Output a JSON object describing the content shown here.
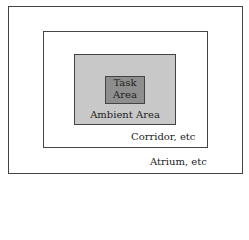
{
  "diagram": {
    "zones": [
      {
        "id": "atrium",
        "label": "Atrium, etc",
        "fill": "#ffffff"
      },
      {
        "id": "corridor",
        "label": "Corridor, etc",
        "fill": "#ffffff"
      },
      {
        "id": "ambient",
        "label": "Ambient Area",
        "fill": "#c8c8c8"
      },
      {
        "id": "task",
        "label_line1": "Task",
        "label_line2": "Area",
        "fill": "#8e8e8e"
      }
    ]
  }
}
